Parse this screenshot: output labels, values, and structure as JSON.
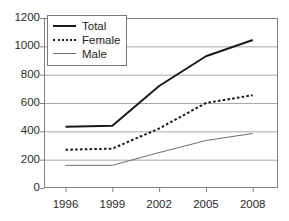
{
  "chart_data": {
    "type": "line",
    "title": "",
    "subtitle": "",
    "xlabel": "",
    "ylabel": "",
    "categories": [
      "1996",
      "1999",
      "2002",
      "2005",
      "2008"
    ],
    "x_tick_labels": [
      "1996",
      "1999",
      "2002",
      "2005",
      "2008"
    ],
    "y_tick_labels": [
      "0",
      "200",
      "400",
      "600",
      "800",
      "1000",
      "1200"
    ],
    "y_tick_values": [
      0,
      200,
      400,
      600,
      800,
      1000,
      1200
    ],
    "ylim": [
      0,
      1200
    ],
    "grid": "horizontal",
    "legend_position": "top-left",
    "series": [
      {
        "name": "Total",
        "values": [
          433,
          440,
          720,
          930,
          1045
        ],
        "color": "#1a1a1a",
        "style": "solid",
        "width": 2
      },
      {
        "name": "Female",
        "values": [
          270,
          278,
          420,
          600,
          655
        ],
        "color": "#1a1a1a",
        "style": "dotted",
        "width": 2
      },
      {
        "name": "Male",
        "values": [
          160,
          160,
          250,
          335,
          385
        ],
        "color": "#6d6d6d",
        "style": "solid",
        "width": 1
      }
    ],
    "annotations": []
  },
  "legend": {
    "items": [
      {
        "label": "Total"
      },
      {
        "label": "Female"
      },
      {
        "label": "Male"
      }
    ]
  },
  "colors": {
    "plot_background": "#ffffff",
    "frame": "#808080",
    "gridline": "#a8a8a8",
    "tick_text": "#2b2b2b",
    "total": "#1a1a1a",
    "female": "#1a1a1a",
    "male": "#6d6d6d"
  }
}
